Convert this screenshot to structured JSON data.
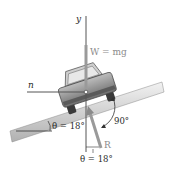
{
  "diagram": {
    "axis_y_label": "y",
    "axis_n_label": "n",
    "weight_label": "W = mg",
    "reaction_label": "R",
    "incline_angle_label": "θ = 18°",
    "reaction_angle_label": "θ = 18°",
    "right_angle_label": "90°",
    "colors": {
      "road_light": "#e6e6e6",
      "road_dark": "#9a9a9a",
      "car_body": "#8c8c8c",
      "axis_line": "#555555",
      "weight_arrow": "#9a9a9a",
      "reaction_arrow": "#9a9a9a"
    }
  }
}
